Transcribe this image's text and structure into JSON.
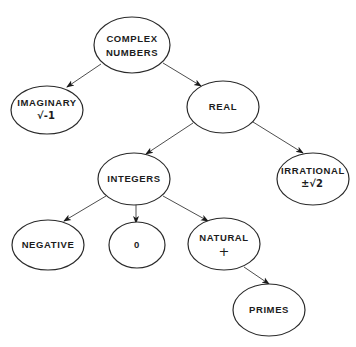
{
  "diagram": {
    "type": "tree",
    "colors": {
      "background": "#ffffff",
      "stroke": "#2a2a2a",
      "text": "#1c1c1c"
    },
    "nodes": {
      "complex": {
        "label_line1": "COMPLEX",
        "label_line2": "NUMBERS",
        "sub": ""
      },
      "imaginary": {
        "label_line1": "IMAGINARY",
        "label_line2": "",
        "sub": "√-1"
      },
      "real": {
        "label_line1": "REAL",
        "label_line2": "",
        "sub": ""
      },
      "integers": {
        "label_line1": "INTEGERS",
        "label_line2": "",
        "sub": ""
      },
      "irrational": {
        "label_line1": "IRRATIONAL",
        "label_line2": "",
        "sub": "±√2"
      },
      "negative": {
        "label_line1": "NEGATIVE",
        "label_line2": "",
        "sub": ""
      },
      "zero": {
        "label_line1": "0",
        "label_line2": "",
        "sub": ""
      },
      "natural": {
        "label_line1": "NATURAL",
        "label_line2": "",
        "sub": "+"
      },
      "primes": {
        "label_line1": "PRIMES",
        "label_line2": "",
        "sub": ""
      }
    },
    "edges": [
      {
        "from": "COMPLEX NUMBERS",
        "to": "IMAGINARY"
      },
      {
        "from": "COMPLEX NUMBERS",
        "to": "REAL"
      },
      {
        "from": "REAL",
        "to": "INTEGERS"
      },
      {
        "from": "REAL",
        "to": "IRRATIONAL"
      },
      {
        "from": "INTEGERS",
        "to": "NEGATIVE"
      },
      {
        "from": "INTEGERS",
        "to": "0"
      },
      {
        "from": "INTEGERS",
        "to": "NATURAL"
      },
      {
        "from": "NATURAL",
        "to": "PRIMES"
      }
    ]
  }
}
